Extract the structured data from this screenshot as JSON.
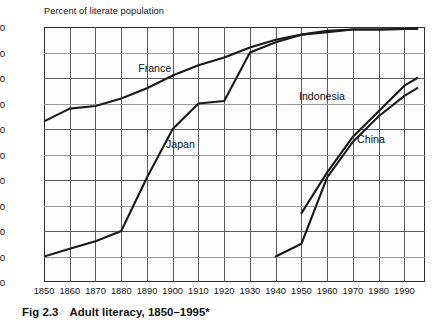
{
  "axis_title": "Percent of literate population",
  "caption": {
    "figure_number": "Fig 2.3",
    "text": "Adult literacy, 1850–1995*"
  },
  "colors": {
    "line": "#1a1a1a",
    "grid": "#5a5a5a",
    "grid_minor": "#9a9a9a",
    "frame": "#2b2b2b",
    "background": "#ffffff",
    "plot_background": "#fdfdfd",
    "text": "#111111"
  },
  "chart_data": {
    "type": "line",
    "title": "Adult literacy, 1850–1995*",
    "xlabel": "",
    "ylabel": "Percent of literate population",
    "xlim": [
      1850,
      1998
    ],
    "ylim": [
      0,
      100
    ],
    "xticks": [
      1850,
      1860,
      1870,
      1880,
      1890,
      1900,
      1910,
      1920,
      1930,
      1940,
      1950,
      1960,
      1970,
      1980,
      1990
    ],
    "yticks": [
      0,
      10,
      20,
      30,
      40,
      50,
      60,
      70,
      80,
      90,
      100
    ],
    "grid": true,
    "legend": "inline-labels",
    "series": [
      {
        "name": "France",
        "label_x": 1893,
        "label_y": 84,
        "points": [
          [
            1850,
            63
          ],
          [
            1860,
            68
          ],
          [
            1870,
            69
          ],
          [
            1880,
            72
          ],
          [
            1890,
            76
          ],
          [
            1900,
            81
          ],
          [
            1910,
            85
          ],
          [
            1920,
            88
          ],
          [
            1930,
            92
          ],
          [
            1940,
            95
          ],
          [
            1950,
            97
          ],
          [
            1960,
            98.5
          ],
          [
            1970,
            99
          ],
          [
            1980,
            99
          ],
          [
            1990,
            99.2
          ],
          [
            1995,
            99.3
          ]
        ]
      },
      {
        "name": "Japan",
        "label_x": 1903,
        "label_y": 54,
        "points": [
          [
            1850,
            10
          ],
          [
            1860,
            13
          ],
          [
            1870,
            16
          ],
          [
            1880,
            20
          ],
          [
            1890,
            41
          ],
          [
            1900,
            60
          ],
          [
            1910,
            70
          ],
          [
            1920,
            71
          ],
          [
            1930,
            90
          ],
          [
            1940,
            94
          ],
          [
            1950,
            97
          ],
          [
            1960,
            98
          ],
          [
            1970,
            99
          ],
          [
            1980,
            99
          ],
          [
            1990,
            99.2
          ],
          [
            1995,
            99.3
          ]
        ]
      },
      {
        "name": "Indonesia",
        "label_x": 1958,
        "label_y": 73,
        "points": [
          [
            1950,
            27
          ],
          [
            1960,
            43
          ],
          [
            1970,
            57
          ],
          [
            1980,
            67
          ],
          [
            1990,
            77
          ],
          [
            1995,
            80
          ]
        ]
      },
      {
        "name": "China",
        "label_x": 1977,
        "label_y": 56,
        "points": [
          [
            1940,
            10
          ],
          [
            1950,
            15
          ],
          [
            1960,
            41
          ],
          [
            1970,
            55
          ],
          [
            1980,
            65
          ],
          [
            1990,
            73
          ],
          [
            1995,
            76
          ]
        ]
      }
    ]
  }
}
